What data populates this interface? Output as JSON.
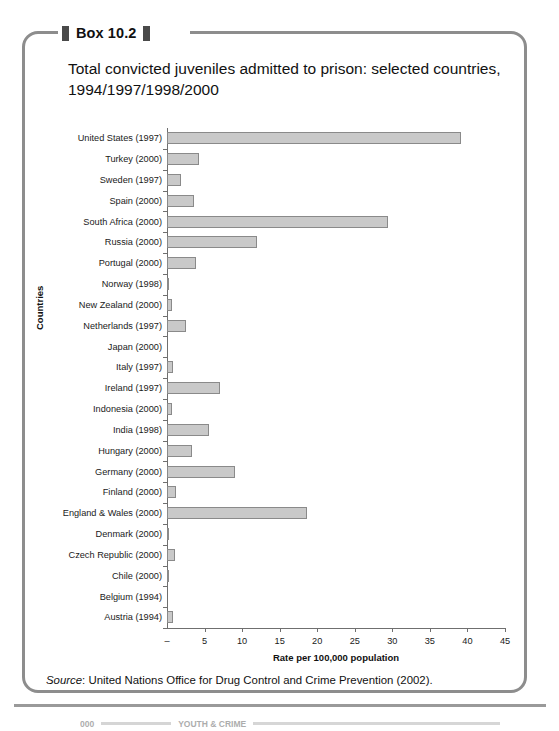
{
  "box": {
    "label": "Box 10.2",
    "title": "Total convicted juveniles admitted to prison: selected countries, 1994/1997/1998/2000"
  },
  "source": {
    "prefix": "Source",
    "text": ": United Nations Office for Drug Control and Crime Prevention (2002)."
  },
  "footer": {
    "page_number": "000",
    "title": "YOUTH & CRIME"
  },
  "colors": {
    "bar_fill": "#c9c9c9",
    "bar_border": "#8a8a8a",
    "box_border": "#8d8d8d",
    "axis": "#6f6f6f",
    "text": "#1a1a1a"
  },
  "chart_data": {
    "type": "bar",
    "orientation": "horizontal",
    "title": "Total convicted juveniles admitted to prison: selected countries, 1994/1997/1998/2000",
    "xlabel": "Rate per 100,000 population",
    "ylabel": "Countries",
    "xlim": [
      0,
      45
    ],
    "xticks": [
      0,
      5,
      10,
      15,
      20,
      25,
      30,
      35,
      40,
      45
    ],
    "xtick_labels": [
      "–",
      "5",
      "10",
      "15",
      "20",
      "25",
      "30",
      "35",
      "40",
      "45"
    ],
    "grid": false,
    "legend": false,
    "categories": [
      "United States (1997)",
      "Turkey (2000)",
      "Sweden (1997)",
      "Spain (2000)",
      "South Africa (2000)",
      "Russia (2000)",
      "Portugal (2000)",
      "Norway (1998)",
      "New Zealand (2000)",
      "Netherlands (1997)",
      "Japan (2000)",
      "Italy (1997)",
      "Ireland (1997)",
      "Indonesia (2000)",
      "India (1998)",
      "Hungary (2000)",
      "Germany (2000)",
      "Finland (2000)",
      "England & Wales (2000)",
      "Denmark (2000)",
      "Czech Republic (2000)",
      "Chile (2000)",
      "Belgium (1994)",
      "Austria (1994)"
    ],
    "values": [
      39.1,
      4.3,
      1.9,
      3.6,
      29.4,
      12.0,
      3.9,
      0.2,
      0.6,
      2.5,
      0.0,
      0.8,
      7.1,
      0.6,
      5.6,
      3.3,
      9.1,
      1.2,
      18.6,
      0.2,
      1.0,
      0.2,
      0.0,
      0.8
    ]
  }
}
